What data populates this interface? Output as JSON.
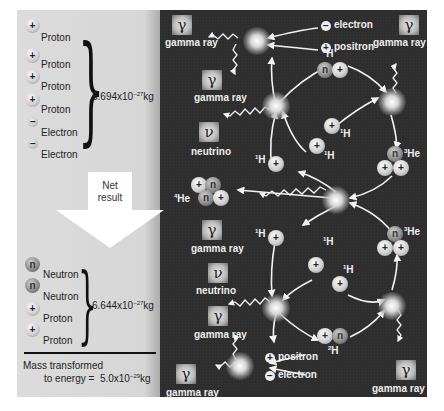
{
  "left_panel": {
    "reactants": [
      {
        "type": "proton",
        "symbol": "+",
        "label": "Proton"
      },
      {
        "type": "proton",
        "symbol": "+",
        "label": "Proton"
      },
      {
        "type": "proton",
        "symbol": "+",
        "label": "Proton"
      },
      {
        "type": "proton",
        "symbol": "+",
        "label": "Proton"
      },
      {
        "type": "electron",
        "symbol": "−",
        "label": "Electron"
      },
      {
        "type": "electron",
        "symbol": "−",
        "label": "Electron"
      }
    ],
    "reactant_mass": {
      "mantissa": "6.694x10",
      "exponent": "−27",
      "unit": "kg"
    },
    "net_arrow": {
      "line1": "Net",
      "line2": "result"
    },
    "products": [
      {
        "type": "neutron",
        "symbol": "n",
        "label": "Neutron"
      },
      {
        "type": "neutron",
        "symbol": "n",
        "label": "Neutron"
      },
      {
        "type": "proton",
        "symbol": "+",
        "label": "Proton"
      },
      {
        "type": "proton",
        "symbol": "+",
        "label": "Proton"
      }
    ],
    "product_mass": {
      "mantissa": "6.644x10",
      "exponent": "−27",
      "unit": "kg"
    },
    "mass_transformed": {
      "line1": "Mass transformed",
      "line2": "to energy =",
      "mantissa": "5.0x10",
      "exponent": "−29",
      "unit": "kg"
    }
  },
  "diagram": {
    "gamma_symbol": "γ",
    "neutrino_symbol": "ν",
    "labels": {
      "gamma_ray": "gamma ray",
      "neutrino": "neutrino",
      "electron": "electron",
      "positron": "positron",
      "electron_sign": "−",
      "positron_sign": "+",
      "h1_sup": "1",
      "h1_base": "H",
      "h2_sup": "2",
      "h2_base": "H",
      "he3_sup": "3",
      "he3_base": "He",
      "he4_sup": "4",
      "he4_base": "He",
      "proton_sign": "+",
      "neutron_sign": "n"
    }
  }
}
